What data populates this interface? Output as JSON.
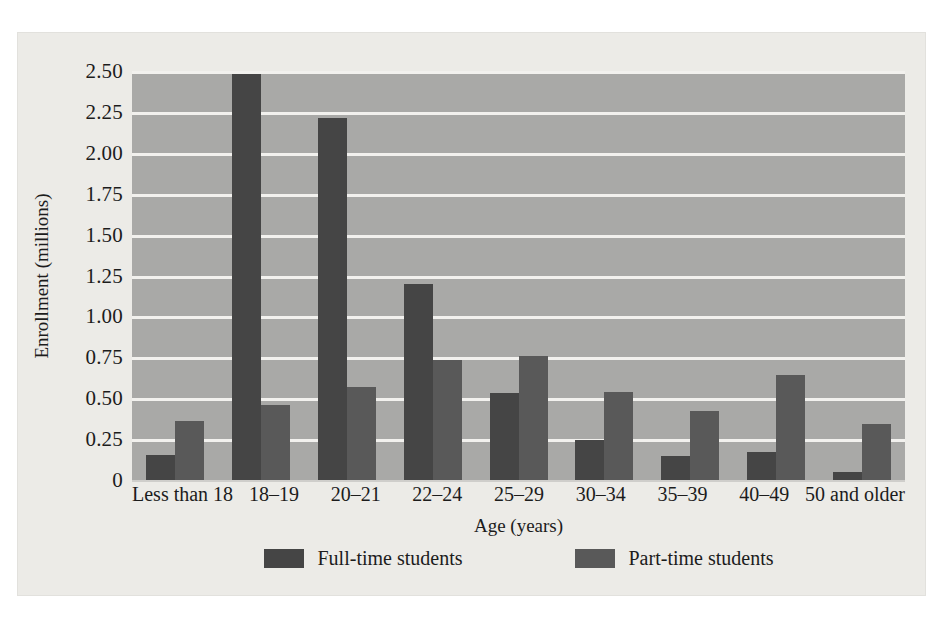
{
  "chart_data": {
    "type": "bar",
    "title": "",
    "xlabel": "Age (years)",
    "ylabel": "Enrollment (millions)",
    "categories": [
      "Less than 18",
      "18–19",
      "20–21",
      "22–24",
      "25–29",
      "30–34",
      "35–39",
      "40–49",
      "50 and older"
    ],
    "series": [
      {
        "name": "Full-time students",
        "color": "#454545",
        "values": [
          0.15,
          2.48,
          2.21,
          1.2,
          0.53,
          0.245,
          0.145,
          0.17,
          0.05
        ]
      },
      {
        "name": "Part-time students",
        "color": "#595959",
        "values": [
          0.36,
          0.46,
          0.57,
          0.735,
          0.755,
          0.54,
          0.42,
          0.64,
          0.34
        ]
      }
    ],
    "ylim": [
      0,
      2.5
    ],
    "ytick_values": [
      0,
      0.25,
      0.5,
      0.75,
      1.0,
      1.25,
      1.5,
      1.75,
      2.0,
      2.25,
      2.5
    ],
    "ytick_labels": [
      "0",
      "0.25",
      "0.50",
      "0.75",
      "1.00",
      "1.25",
      "1.50",
      "1.75",
      "2.00",
      "2.25",
      "2.50"
    ],
    "grid": true,
    "grid_color": "#f2f1ee",
    "plot_background": "#a9a9a7",
    "figure_background": "#ecebe7",
    "legend_position": "bottom-center"
  }
}
